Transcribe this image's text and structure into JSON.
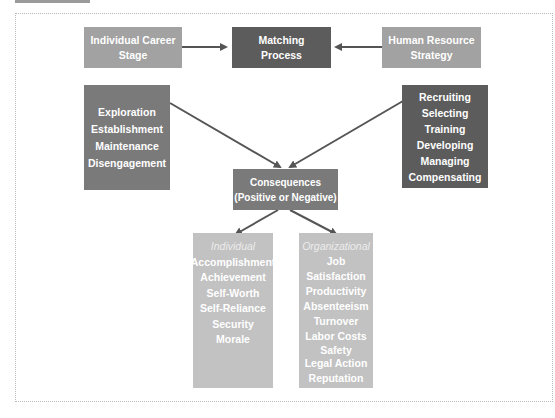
{
  "diagram": {
    "top_row": {
      "career_stage": {
        "line1": "Individual Career",
        "line2": "Stage"
      },
      "matching": {
        "line1": "Matching",
        "line2": "Process"
      },
      "hr_strategy": {
        "line1": "Human Resource",
        "line2": "Strategy"
      }
    },
    "career_stages": [
      "Exploration",
      "Establishment",
      "Maintenance",
      "Disengagement"
    ],
    "hr_activities": [
      "Recruiting",
      "Selecting",
      "Training",
      "Developing",
      "Managing",
      "Compensating"
    ],
    "consequences": {
      "line1": "Consequences",
      "line2": "(Positive or Negative)"
    },
    "individual": {
      "heading": "Individual",
      "items": [
        "Accomplishment",
        "Achievement",
        "Self-Worth",
        "Self-Reliance",
        "Security",
        "Morale"
      ]
    },
    "organizational": {
      "heading": "Organizational",
      "items": [
        "Job Satisfaction",
        "Productivity",
        "Absenteeism",
        "Turnover",
        "Labor Costs",
        "Safety",
        "Legal Action",
        "Reputation"
      ]
    },
    "colors": {
      "light_box": "#a2a2a2",
      "dark_box": "#5c5c5c",
      "mid_box": "#7a7a7a",
      "pale_box": "#c2c2c2",
      "arrow": "#555555"
    }
  }
}
